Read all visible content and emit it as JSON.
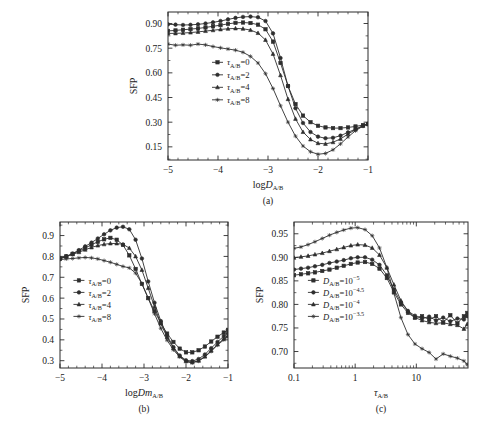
{
  "figure": {
    "ylabel": "SFP",
    "panels": [
      "(a)",
      "(b)",
      "(c)"
    ]
  },
  "chart_data": [
    {
      "id": "a",
      "type": "line",
      "title": "",
      "caption": "(a)",
      "xlabel": "logD",
      "xlabel_sub": "A/B",
      "xlabel_italic": "D",
      "ylabel": "SFP",
      "xscale": "linear",
      "xlim": [
        -5,
        -1
      ],
      "ylim": [
        0.07,
        0.97
      ],
      "xticks": [
        -5,
        -4,
        -3,
        -2,
        -1
      ],
      "xticklabels": [
        "-5",
        "-4",
        "-3",
        "-2",
        "-1"
      ],
      "yticks": [
        0.15,
        0.3,
        0.45,
        0.6,
        0.75,
        0.9
      ],
      "yticklabels": [
        "0.15",
        "0.30",
        "0.45",
        "0.60",
        "0.75",
        "0.90"
      ],
      "grid": false,
      "legend_position": "lower-left",
      "series": [
        {
          "name": "tau_A/B=0",
          "label": "τ",
          "label_sub": "A/B",
          "label_val": "=0",
          "marker": "square",
          "x": [
            -5.0,
            -4.85,
            -4.7,
            -4.55,
            -4.4,
            -4.25,
            -4.1,
            -3.95,
            -3.8,
            -3.65,
            -3.5,
            -3.35,
            -3.2,
            -3.05,
            -2.9,
            -2.75,
            -2.6,
            -2.45,
            -2.3,
            -2.15,
            -2.0,
            -1.85,
            -1.7,
            -1.55,
            -1.4,
            -1.25,
            -1.1,
            -1.0
          ],
          "y": [
            0.855,
            0.858,
            0.862,
            0.866,
            0.87,
            0.876,
            0.883,
            0.89,
            0.898,
            0.904,
            0.906,
            0.903,
            0.893,
            0.865,
            0.79,
            0.66,
            0.52,
            0.41,
            0.34,
            0.3,
            0.278,
            0.268,
            0.264,
            0.264,
            0.268,
            0.274,
            0.282,
            0.288
          ]
        },
        {
          "name": "tau_A/B=2",
          "label": "τ",
          "label_sub": "A/B",
          "label_val": "=2",
          "marker": "circle",
          "x": [
            -5.0,
            -4.85,
            -4.7,
            -4.55,
            -4.4,
            -4.25,
            -4.1,
            -3.95,
            -3.8,
            -3.65,
            -3.5,
            -3.35,
            -3.2,
            -3.05,
            -2.9,
            -2.75,
            -2.6,
            -2.45,
            -2.3,
            -2.15,
            -2.0,
            -1.85,
            -1.7,
            -1.55,
            -1.4,
            -1.25,
            -1.1,
            -1.0
          ],
          "y": [
            0.895,
            0.893,
            0.891,
            0.892,
            0.895,
            0.9,
            0.907,
            0.915,
            0.925,
            0.934,
            0.94,
            0.942,
            0.938,
            0.915,
            0.84,
            0.69,
            0.52,
            0.385,
            0.295,
            0.24,
            0.212,
            0.202,
            0.205,
            0.218,
            0.238,
            0.258,
            0.278,
            0.288
          ]
        },
        {
          "name": "tau_A/B=4",
          "label": "τ",
          "label_sub": "A/B",
          "label_val": "=4",
          "marker": "triangle",
          "x": [
            -5.0,
            -4.85,
            -4.7,
            -4.55,
            -4.4,
            -4.25,
            -4.1,
            -3.95,
            -3.8,
            -3.65,
            -3.5,
            -3.35,
            -3.2,
            -3.05,
            -2.9,
            -2.75,
            -2.6,
            -2.45,
            -2.3,
            -2.15,
            -2.0,
            -1.85,
            -1.7,
            -1.55,
            -1.4,
            -1.25,
            -1.1,
            -1.0
          ],
          "y": [
            0.84,
            0.84,
            0.842,
            0.845,
            0.849,
            0.854,
            0.859,
            0.864,
            0.868,
            0.87,
            0.868,
            0.86,
            0.842,
            0.8,
            0.715,
            0.585,
            0.44,
            0.32,
            0.24,
            0.195,
            0.172,
            0.168,
            0.178,
            0.198,
            0.228,
            0.255,
            0.278,
            0.29
          ]
        },
        {
          "name": "tau_A/B=8",
          "label": "τ",
          "label_sub": "A/B",
          "label_val": "=8",
          "marker": "star",
          "x": [
            -5.0,
            -4.85,
            -4.7,
            -4.55,
            -4.4,
            -4.25,
            -4.1,
            -3.95,
            -3.8,
            -3.65,
            -3.5,
            -3.35,
            -3.2,
            -3.05,
            -2.9,
            -2.75,
            -2.6,
            -2.45,
            -2.3,
            -2.15,
            -2.0,
            -1.85,
            -1.7,
            -1.55,
            -1.4,
            -1.25,
            -1.1,
            -1.0
          ],
          "y": [
            0.775,
            0.768,
            0.77,
            0.768,
            0.775,
            0.77,
            0.76,
            0.752,
            0.745,
            0.738,
            0.725,
            0.7,
            0.66,
            0.595,
            0.505,
            0.4,
            0.3,
            0.215,
            0.155,
            0.12,
            0.105,
            0.11,
            0.132,
            0.168,
            0.21,
            0.248,
            0.276,
            0.292
          ]
        }
      ]
    },
    {
      "id": "b",
      "type": "line",
      "title": "",
      "caption": "(b)",
      "xlabel": "logDm",
      "xlabel_sub": "A/B",
      "xlabel_italic": "Dm",
      "ylabel": "SFP",
      "xscale": "linear",
      "xlim": [
        -5,
        -1
      ],
      "ylim": [
        0.265,
        0.965
      ],
      "xticks": [
        -5,
        -4,
        -3,
        -2,
        -1
      ],
      "xticklabels": [
        "-5",
        "-4",
        "-3",
        "-2",
        "-1"
      ],
      "yticks": [
        0.3,
        0.4,
        0.5,
        0.6,
        0.7,
        0.8,
        0.9
      ],
      "yticklabels": [
        "0.3",
        "0.4",
        "0.5",
        "0.6",
        "0.7",
        "0.8",
        "0.9"
      ],
      "grid": false,
      "legend_position": "lower-left",
      "series": [
        {
          "name": "tau_A/B=0",
          "label": "τ",
          "label_sub": "A/B",
          "label_val": "=0",
          "marker": "square",
          "x": [
            -5.0,
            -4.85,
            -4.7,
            -4.55,
            -4.4,
            -4.25,
            -4.1,
            -3.95,
            -3.8,
            -3.65,
            -3.5,
            -3.35,
            -3.2,
            -3.05,
            -2.9,
            -2.75,
            -2.6,
            -2.45,
            -2.3,
            -2.15,
            -2.0,
            -1.85,
            -1.7,
            -1.55,
            -1.4,
            -1.25,
            -1.1,
            -1.0
          ],
          "y": [
            0.79,
            0.8,
            0.812,
            0.826,
            0.84,
            0.856,
            0.87,
            0.882,
            0.889,
            0.88,
            0.855,
            0.805,
            0.74,
            0.668,
            0.6,
            0.538,
            0.48,
            0.43,
            0.39,
            0.358,
            0.34,
            0.34,
            0.35,
            0.368,
            0.392,
            0.415,
            0.435,
            0.448
          ]
        },
        {
          "name": "tau_A/B=2",
          "label": "τ",
          "label_sub": "A/B",
          "label_val": "=2",
          "marker": "circle",
          "x": [
            -5.0,
            -4.85,
            -4.7,
            -4.55,
            -4.4,
            -4.25,
            -4.1,
            -3.95,
            -3.8,
            -3.65,
            -3.5,
            -3.35,
            -3.2,
            -3.05,
            -2.9,
            -2.75,
            -2.6,
            -2.45,
            -2.3,
            -2.15,
            -2.0,
            -1.85,
            -1.7,
            -1.55,
            -1.4,
            -1.25,
            -1.1,
            -1.0
          ],
          "y": [
            0.788,
            0.8,
            0.814,
            0.83,
            0.848,
            0.866,
            0.886,
            0.906,
            0.925,
            0.938,
            0.942,
            0.93,
            0.88,
            0.79,
            0.68,
            0.578,
            0.49,
            0.42,
            0.365,
            0.325,
            0.302,
            0.298,
            0.308,
            0.33,
            0.36,
            0.39,
            0.418,
            0.432
          ]
        },
        {
          "name": "tau_A/B=4",
          "label": "τ",
          "label_sub": "A/B",
          "label_val": "=4",
          "marker": "triangle",
          "x": [
            -5.0,
            -4.85,
            -4.7,
            -4.55,
            -4.4,
            -4.25,
            -4.1,
            -3.95,
            -3.8,
            -3.65,
            -3.5,
            -3.35,
            -3.2,
            -3.05,
            -2.9,
            -2.75,
            -2.6,
            -2.45,
            -2.3,
            -2.15,
            -2.0,
            -1.85,
            -1.7,
            -1.55,
            -1.4,
            -1.25,
            -1.1,
            -1.0
          ],
          "y": [
            0.792,
            0.8,
            0.81,
            0.82,
            0.832,
            0.843,
            0.852,
            0.858,
            0.862,
            0.862,
            0.858,
            0.84,
            0.8,
            0.735,
            0.648,
            0.558,
            0.478,
            0.412,
            0.36,
            0.322,
            0.298,
            0.292,
            0.3,
            0.32,
            0.348,
            0.378,
            0.405,
            0.42
          ]
        },
        {
          "name": "tau_A/B=8",
          "label": "τ",
          "label_sub": "A/B",
          "label_val": "=8",
          "marker": "star",
          "x": [
            -5.0,
            -4.85,
            -4.7,
            -4.55,
            -4.4,
            -4.25,
            -4.1,
            -3.95,
            -3.8,
            -3.65,
            -3.5,
            -3.35,
            -3.2,
            -3.05,
            -2.9,
            -2.75,
            -2.6,
            -2.45,
            -2.3,
            -2.15,
            -2.0,
            -1.85,
            -1.7,
            -1.55,
            -1.4,
            -1.25,
            -1.1,
            -1.0
          ],
          "y": [
            0.785,
            0.788,
            0.79,
            0.793,
            0.795,
            0.793,
            0.788,
            0.78,
            0.772,
            0.762,
            0.752,
            0.745,
            0.72,
            0.67,
            0.6,
            0.525,
            0.455,
            0.398,
            0.352,
            0.318,
            0.295,
            0.29,
            0.298,
            0.318,
            0.345,
            0.375,
            0.4,
            0.415
          ]
        }
      ]
    },
    {
      "id": "c",
      "type": "line",
      "title": "",
      "caption": "(c)",
      "xlabel": "τ",
      "xlabel_sub": "A/B",
      "xlabel_italic": "",
      "ylabel": "SFP",
      "xscale": "log",
      "xlim": [
        0.1,
        70
      ],
      "ylim": [
        0.665,
        0.975
      ],
      "xticks": [
        0.1,
        1,
        10
      ],
      "xticklabels": [
        "0.1",
        "1",
        "10"
      ],
      "yticks": [
        0.7,
        0.75,
        0.8,
        0.85,
        0.9,
        0.95
      ],
      "yticklabels": [
        "0.70",
        "0.75",
        "0.80",
        "0.85",
        "0.90",
        "0.95"
      ],
      "grid": false,
      "legend_position": "center-left",
      "series": [
        {
          "name": "D_A/B=10^-5",
          "label": "D",
          "label_sub": "A/B",
          "label_val": "=10",
          "label_sup": "-5",
          "marker": "square",
          "x": [
            0.1,
            0.13,
            0.17,
            0.22,
            0.29,
            0.38,
            0.5,
            0.65,
            0.85,
            1.1,
            1.45,
            1.9,
            2.5,
            3.3,
            4.3,
            5.6,
            7.3,
            9.5,
            12.4,
            16.2,
            21,
            27.5,
            36,
            47,
            60,
            68
          ],
          "y": [
            0.862,
            0.864,
            0.866,
            0.868,
            0.871,
            0.874,
            0.878,
            0.882,
            0.886,
            0.889,
            0.89,
            0.886,
            0.876,
            0.856,
            0.826,
            0.8,
            0.782,
            0.772,
            0.775,
            0.768,
            0.775,
            0.762,
            0.777,
            0.76,
            0.775,
            0.782
          ]
        },
        {
          "name": "D_A/B=10^-4.5",
          "label": "D",
          "label_sub": "A/B",
          "label_val": "=10",
          "label_sup": "-4.5",
          "marker": "circle",
          "x": [
            0.1,
            0.13,
            0.17,
            0.22,
            0.29,
            0.38,
            0.5,
            0.65,
            0.85,
            1.1,
            1.45,
            1.9,
            2.5,
            3.3,
            4.3,
            5.6,
            7.3,
            9.5,
            12.4,
            16.2,
            21,
            27.5,
            36,
            47,
            60,
            68
          ],
          "y": [
            0.874,
            0.876,
            0.878,
            0.881,
            0.884,
            0.888,
            0.891,
            0.894,
            0.898,
            0.9,
            0.9,
            0.895,
            0.884,
            0.862,
            0.832,
            0.804,
            0.786,
            0.776,
            0.77,
            0.774,
            0.766,
            0.772,
            0.764,
            0.77,
            0.768,
            0.775
          ]
        },
        {
          "name": "D_A/B=10^-4",
          "label": "D",
          "label_sub": "A/B",
          "label_val": "=10",
          "label_sup": "-4",
          "marker": "triangle",
          "x": [
            0.1,
            0.13,
            0.17,
            0.22,
            0.29,
            0.38,
            0.5,
            0.65,
            0.85,
            1.1,
            1.45,
            1.9,
            2.5,
            3.3,
            4.3,
            5.6,
            7.3,
            9.5,
            12.4,
            16.2,
            21,
            27.5,
            36,
            47,
            60,
            68
          ],
          "y": [
            0.899,
            0.901,
            0.903,
            0.906,
            0.909,
            0.913,
            0.917,
            0.921,
            0.925,
            0.927,
            0.926,
            0.92,
            0.905,
            0.878,
            0.842,
            0.808,
            0.786,
            0.772,
            0.766,
            0.762,
            0.76,
            0.761,
            0.758,
            0.756,
            0.748,
            0.758
          ]
        },
        {
          "name": "D_A/B=10^-3.5",
          "label": "D",
          "label_sub": "A/B",
          "label_val": "=10",
          "label_sup": "-3.5",
          "marker": "star",
          "x": [
            0.1,
            0.13,
            0.17,
            0.22,
            0.29,
            0.38,
            0.5,
            0.65,
            0.85,
            1.1,
            1.45,
            1.9,
            2.5,
            3.3,
            4.3,
            5.6,
            7.3,
            9.5,
            12.4,
            16.2,
            21,
            27.5,
            36,
            47,
            60,
            68
          ],
          "y": [
            0.919,
            0.922,
            0.927,
            0.933,
            0.94,
            0.947,
            0.953,
            0.958,
            0.962,
            0.963,
            0.959,
            0.946,
            0.92,
            0.878,
            0.824,
            0.772,
            0.736,
            0.716,
            0.706,
            0.698,
            0.684,
            0.695,
            0.69,
            0.686,
            0.68,
            0.672
          ]
        }
      ]
    }
  ]
}
